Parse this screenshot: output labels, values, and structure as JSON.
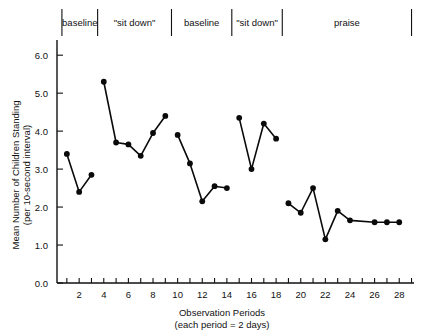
{
  "chart_data": {
    "type": "line",
    "title": "",
    "subtitle": "",
    "xlabel": "Observation Periods",
    "xlabel_sub": "(each period = 2 days)",
    "ylabel": "Mean Number of Children Standing",
    "ylabel_sub": "(per 10-second interval)",
    "xlim": [
      0.2,
      29.2
    ],
    "ylim": [
      0.0,
      6.4
    ],
    "grid": false,
    "legend_position": "none",
    "y_ticks": [
      0.0,
      1.0,
      2.0,
      3.0,
      4.0,
      5.0,
      6.0
    ],
    "y_tick_labels": [
      "0.0",
      "1.0",
      "2.0",
      "3.0",
      "4.0",
      "5.0",
      "6.0"
    ],
    "x_ticks": [
      1,
      2,
      3,
      4,
      5,
      6,
      7,
      8,
      9,
      10,
      11,
      12,
      13,
      14,
      15,
      16,
      17,
      18,
      19,
      20,
      21,
      22,
      23,
      24,
      25,
      26,
      27,
      28,
      29
    ],
    "x_tick_labels_shown": [
      "2",
      "4",
      "6",
      "8",
      "10",
      "12",
      "14",
      "16",
      "18",
      "20",
      "22",
      "24",
      "26",
      "28"
    ],
    "x_tick_label_values": [
      2,
      4,
      6,
      8,
      10,
      12,
      14,
      16,
      18,
      20,
      22,
      24,
      26,
      28
    ],
    "phases": [
      {
        "label": "baseline",
        "x_start": 0.6,
        "x_end": 3.5
      },
      {
        "label": "\"sit down\"",
        "x_start": 3.5,
        "x_end": 9.5
      },
      {
        "label": "baseline",
        "x_start": 9.5,
        "x_end": 14.4
      },
      {
        "label": "\"sit down\"",
        "x_start": 14.4,
        "x_end": 18.5
      },
      {
        "label": "praise",
        "x_start": 18.5,
        "x_end": 29.0
      }
    ],
    "series": [
      {
        "name": "baseline 1",
        "x": [
          1,
          2,
          3
        ],
        "values": [
          3.4,
          2.4,
          2.85
        ]
      },
      {
        "name": "\"sit down\" 1",
        "x": [
          4,
          5,
          6,
          7,
          8,
          9
        ],
        "values": [
          5.3,
          3.7,
          3.65,
          3.35,
          3.95,
          4.4
        ]
      },
      {
        "name": "baseline 2",
        "x": [
          10,
          11,
          12,
          13,
          14
        ],
        "values": [
          3.9,
          3.15,
          2.15,
          2.55,
          2.5
        ]
      },
      {
        "name": "\"sit down\" 2",
        "x": [
          15,
          16,
          17,
          18
        ],
        "values": [
          4.35,
          3.0,
          4.2,
          3.8
        ]
      },
      {
        "name": "praise",
        "x": [
          19,
          20,
          21,
          22,
          23,
          24,
          26,
          27,
          28
        ],
        "values": [
          2.1,
          1.85,
          2.5,
          1.15,
          1.9,
          1.65,
          1.6,
          1.6,
          1.6
        ]
      }
    ],
    "colors": {
      "line": "#0a0a0a",
      "marker": "#0a0a0a",
      "axis": "#111111",
      "background": "#ffffff"
    }
  }
}
